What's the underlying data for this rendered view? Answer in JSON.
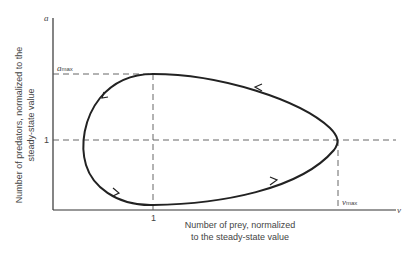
{
  "diagram": {
    "type": "phase-plane limit cycle (predator-prey)",
    "axes": {
      "y_axis_symbol": "a",
      "x_axis_symbol": "v",
      "y_axis_label_line1": "Number of predators, normalized to the",
      "y_axis_label_line2": "steady-state value",
      "x_axis_label_line1": "Number of prey, normalized",
      "x_axis_label_line2": "to the steady-state value"
    },
    "markers": {
      "a_max_symbol": "a",
      "a_max_sub": "max",
      "v_max_symbol": "v",
      "v_max_sub": "max",
      "y_tick_one": "1",
      "x_tick_one": "1"
    },
    "curve": {
      "direction": "counterclockwise",
      "arrows": 4,
      "color": "#222222"
    },
    "colors": {
      "line": "#222222",
      "dashed": "#555555",
      "text": "#444444"
    }
  }
}
